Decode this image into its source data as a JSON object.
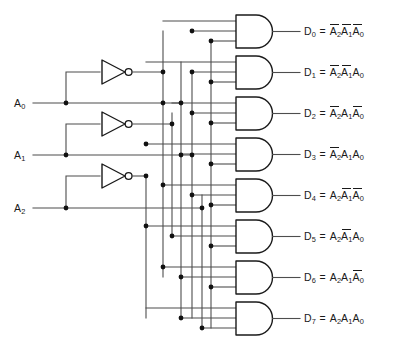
{
  "canvas": {
    "width": 393,
    "height": 358,
    "background": "#ffffff"
  },
  "colors": {
    "wire": "#4d4d4d",
    "gate_outline": "#1a1a1a",
    "junction": "#111111",
    "text": "#1a1a1a",
    "background": "#ffffff"
  },
  "inputs": [
    {
      "name": "A0",
      "label_text": "A",
      "label_sub": "0",
      "y": 103
    },
    {
      "name": "A1",
      "label_text": "A",
      "label_sub": "1",
      "y": 155
    },
    {
      "name": "A2",
      "label_text": "A",
      "label_sub": "2",
      "y": 208
    }
  ],
  "inverters": [
    {
      "name": "inverter-a0",
      "input": "A0",
      "output": "A0-bar",
      "y": 72
    },
    {
      "name": "inverter-a1",
      "input": "A1",
      "output": "A1-bar",
      "y": 124
    },
    {
      "name": "inverter-a2",
      "input": "A2",
      "output": "A2-bar",
      "y": 176
    }
  ],
  "gates": [
    {
      "name": "and-gate-d0",
      "output": "D0",
      "y": 31
    },
    {
      "name": "and-gate-d1",
      "output": "D1",
      "y": 72
    },
    {
      "name": "and-gate-d2",
      "output": "D2",
      "y": 113
    },
    {
      "name": "and-gate-d3",
      "output": "D3",
      "y": 154
    },
    {
      "name": "and-gate-d4",
      "output": "D4",
      "y": 195
    },
    {
      "name": "and-gate-d5",
      "output": "D5",
      "y": 236
    },
    {
      "name": "and-gate-d6",
      "output": "D6",
      "y": 277
    },
    {
      "name": "and-gate-d7",
      "output": "D7",
      "y": 318
    }
  ],
  "outputs": [
    {
      "name": "D0",
      "out_text": "D",
      "out_sub": "0",
      "terms": [
        {
          "var": "A",
          "sub": "2",
          "bar": true
        },
        {
          "var": "A",
          "sub": "1",
          "bar": true
        },
        {
          "var": "A",
          "sub": "0",
          "bar": true
        }
      ],
      "plain": "D0 = !A2 !A1 !A0"
    },
    {
      "name": "D1",
      "out_text": "D",
      "out_sub": "1",
      "terms": [
        {
          "var": "A",
          "sub": "2",
          "bar": true
        },
        {
          "var": "A",
          "sub": "1",
          "bar": true
        },
        {
          "var": "A",
          "sub": "0",
          "bar": false
        }
      ],
      "plain": "D1 = !A2 !A1 A0"
    },
    {
      "name": "D2",
      "out_text": "D",
      "out_sub": "2",
      "terms": [
        {
          "var": "A",
          "sub": "2",
          "bar": true
        },
        {
          "var": "A",
          "sub": "1",
          "bar": false
        },
        {
          "var": "A",
          "sub": "0",
          "bar": true
        }
      ],
      "plain": "D2 = !A2 A1 !A0"
    },
    {
      "name": "D3",
      "out_text": "D",
      "out_sub": "3",
      "terms": [
        {
          "var": "A",
          "sub": "2",
          "bar": true
        },
        {
          "var": "A",
          "sub": "1",
          "bar": false
        },
        {
          "var": "A",
          "sub": "0",
          "bar": false
        }
      ],
      "plain": "D3 = !A2 A1 A0"
    },
    {
      "name": "D4",
      "out_text": "D",
      "out_sub": "4",
      "terms": [
        {
          "var": "A",
          "sub": "2",
          "bar": false
        },
        {
          "var": "A",
          "sub": "1",
          "bar": true
        },
        {
          "var": "A",
          "sub": "0",
          "bar": true
        }
      ],
      "plain": "D4 = A2 !A1 !A0"
    },
    {
      "name": "D5",
      "out_text": "D",
      "out_sub": "5",
      "terms": [
        {
          "var": "A",
          "sub": "2",
          "bar": false
        },
        {
          "var": "A",
          "sub": "1",
          "bar": true
        },
        {
          "var": "A",
          "sub": "0",
          "bar": false
        }
      ],
      "plain": "D5 = A2 !A1 A0"
    },
    {
      "name": "D6",
      "out_text": "D",
      "out_sub": "6",
      "terms": [
        {
          "var": "A",
          "sub": "2",
          "bar": false
        },
        {
          "var": "A",
          "sub": "1",
          "bar": false
        },
        {
          "var": "A",
          "sub": "0",
          "bar": true
        }
      ],
      "plain": "D6 = A2 A1 !A0"
    },
    {
      "name": "D7",
      "out_text": "D",
      "out_sub": "7",
      "terms": [
        {
          "var": "A",
          "sub": "2",
          "bar": false
        },
        {
          "var": "A",
          "sub": "1",
          "bar": false
        },
        {
          "var": "A",
          "sub": "0",
          "bar": false
        }
      ],
      "plain": "D7 = A2 A1 A0"
    }
  ],
  "equals_sign": "=",
  "buses": [
    {
      "name": "bus-a2bar",
      "x": 146
    },
    {
      "name": "bus-a0bar",
      "x": 163
    },
    {
      "name": "bus-a1bar",
      "x": 172
    },
    {
      "name": "bus-a0",
      "x": 181
    },
    {
      "name": "bus-a1",
      "x": 192
    },
    {
      "name": "bus-a2",
      "x": 202
    },
    {
      "name": "bus-aux",
      "x": 211
    }
  ]
}
